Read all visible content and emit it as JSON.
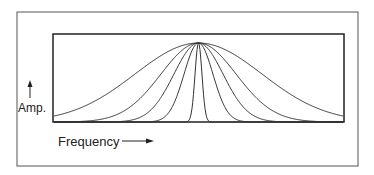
{
  "figure": {
    "y_label": "Amp.",
    "x_label": "Frequency",
    "line_color": "#333333",
    "background": "#ffffff"
  },
  "chart_data": {
    "type": "line",
    "title": "",
    "xlabel": "Frequency",
    "ylabel": "Amp.",
    "center": 0.5,
    "peak": 1.0,
    "series": [
      {
        "name": "curve-1",
        "width_sigma": 0.22
      },
      {
        "name": "curve-2",
        "width_sigma": 0.13
      },
      {
        "name": "curve-3",
        "width_sigma": 0.085
      },
      {
        "name": "curve-4",
        "width_sigma": 0.05
      },
      {
        "name": "curve-5",
        "width_sigma": 0.012
      }
    ],
    "xlim": [
      0,
      1
    ],
    "ylim": [
      0,
      1.1
    ],
    "grid": false,
    "legend": "none"
  }
}
